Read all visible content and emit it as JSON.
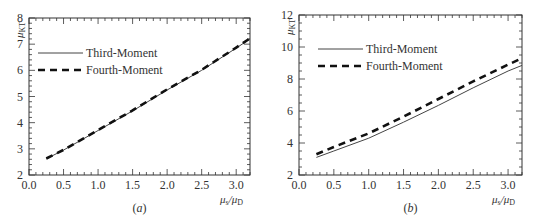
{
  "chart_data": [
    {
      "type": "line",
      "panel_label": "(a)",
      "title": "",
      "xlabel": "μs/μD",
      "ylabel": "μKT",
      "xlim": [
        0.0,
        3.2
      ],
      "ylim": [
        2,
        8
      ],
      "xticks": [
        "0.0",
        "0.5",
        "1.0",
        "1.5",
        "2.0",
        "2.5",
        "3.0"
      ],
      "yticks": [
        "2",
        "3",
        "4",
        "5",
        "6",
        "7",
        "8"
      ],
      "grid": false,
      "legend_position": "upper-left",
      "x": [
        0.25,
        0.5,
        1.0,
        1.5,
        2.0,
        2.5,
        3.0,
        3.2
      ],
      "series": [
        {
          "name": "Third-Moment",
          "style": "solid",
          "values": [
            2.62,
            2.95,
            3.7,
            4.45,
            5.25,
            6.0,
            6.85,
            7.2
          ]
        },
        {
          "name": "Fourth-Moment",
          "style": "dashed",
          "values": [
            2.63,
            2.96,
            3.72,
            4.47,
            5.27,
            6.02,
            6.87,
            7.22
          ]
        }
      ]
    },
    {
      "type": "line",
      "panel_label": "(b)",
      "title": "",
      "xlabel": "μs/μD",
      "ylabel": "μKT",
      "xlim": [
        0.0,
        3.2
      ],
      "ylim": [
        2,
        12
      ],
      "xticks": [
        "0.0",
        "0.5",
        "1.0",
        "1.5",
        "2.0",
        "2.5",
        "3.0"
      ],
      "yticks": [
        "2",
        "4",
        "6",
        "8",
        "10",
        "12"
      ],
      "grid": false,
      "legend_position": "upper-left",
      "x": [
        0.25,
        0.5,
        1.0,
        1.5,
        2.0,
        2.5,
        3.0,
        3.2
      ],
      "series": [
        {
          "name": "Third-Moment",
          "style": "solid",
          "values": [
            3.1,
            3.5,
            4.3,
            5.3,
            6.35,
            7.45,
            8.5,
            8.85
          ]
        },
        {
          "name": "Fourth-Moment",
          "style": "dashed",
          "values": [
            3.3,
            3.75,
            4.6,
            5.65,
            6.75,
            7.85,
            8.9,
            9.3
          ]
        }
      ]
    }
  ],
  "panels": {
    "a": {
      "label": "(a)",
      "legend": [
        "Third-Moment",
        "Fourth-Moment"
      ]
    },
    "b": {
      "label": "(b)",
      "legend": [
        "Third-Moment",
        "Fourth-Moment"
      ]
    }
  }
}
